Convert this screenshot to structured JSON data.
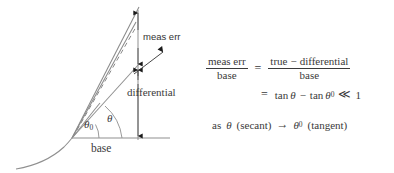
{
  "diagram": {
    "labels": {
      "meas_err": "meas err",
      "differential": "differential",
      "base": "base",
      "theta_zero_symbol": "θ",
      "theta_zero_subscript": "0",
      "theta_symbol": "θ"
    },
    "colors": {
      "stroke": "#808080",
      "curve": "#8a8a8a",
      "text": "#3a3a3a",
      "arrow": "#1a1a1a",
      "background": "#ffffff"
    },
    "geometry": {
      "vertex": [
        72,
        138
      ],
      "base_line_end": [
        170,
        138
      ],
      "vertical_line_x": 138,
      "vertical_line_top": 9,
      "vertical_line_bottom": 140,
      "secant_line_end": [
        138,
        8
      ],
      "tangent_line_end": [
        138,
        65
      ],
      "dashed_line_end": [
        136,
        22
      ],
      "meas_err_tick_upper": 14,
      "meas_err_tick_lower": 66,
      "curve_start": [
        16,
        169
      ],
      "curve_end": [
        100,
        104
      ]
    }
  },
  "math": {
    "line1": {
      "lhs_numerator": "meas err",
      "lhs_denominator": "base",
      "equals": "=",
      "rhs_numerator_left": "true",
      "rhs_numerator_minus": "−",
      "rhs_numerator_right": "differential",
      "rhs_denominator": "base"
    },
    "line2": {
      "equals": "=",
      "tan_1": "tan",
      "theta_1": "θ",
      "minus": "−",
      "tan_2": "tan",
      "theta_2": "θ",
      "theta_2_subscript": "0",
      "much_less": "≪",
      "one": "1"
    },
    "line3": {
      "as_word": "as",
      "theta": "θ",
      "secant_paren": "(secant)",
      "arrow": "→",
      "theta_zero": "θ",
      "theta_zero_subscript": "0",
      "tangent_paren": "(tangent)"
    }
  }
}
